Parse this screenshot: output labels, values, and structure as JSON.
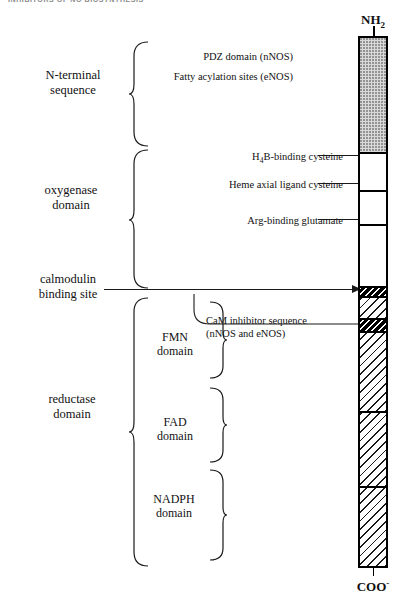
{
  "running_head": "INHIBITORS OF NO BIOSYNTHESIS",
  "diagram": {
    "termini": {
      "n_terminus": "NH2",
      "n_terminus_base": "NH",
      "n_terminus_sub": "2",
      "c_terminus": "COO",
      "c_terminus_sup": "-"
    },
    "left_labels": [
      {
        "id": "n-terminal",
        "text": "N-terminal\nsequence"
      },
      {
        "id": "oxygenase",
        "text": "oxygenase\ndomain"
      },
      {
        "id": "calmodulin",
        "text": "calmodulin\nbinding site"
      },
      {
        "id": "reductase",
        "text": "reductase\ndomain"
      }
    ],
    "inner_labels": [
      {
        "id": "fmn",
        "text": "FMN\ndomain"
      },
      {
        "id": "fad",
        "text": "FAD\ndomain"
      },
      {
        "id": "nadph",
        "text": "NADPH\ndomain"
      }
    ],
    "annotations": [
      {
        "id": "pdz",
        "text": "PDZ domain (nNOS)"
      },
      {
        "id": "fatty",
        "text": "Fatty acylation sites (eNOS)"
      },
      {
        "id": "h4b",
        "text": "H4B-binding cysteine",
        "pre": "H",
        "sub": "4",
        "post": "B-binding cysteine"
      },
      {
        "id": "heme",
        "text": "Heme axial ligand cysteine"
      },
      {
        "id": "arg",
        "text": "Arg-binding glutamate"
      },
      {
        "id": "cam-inhibitor",
        "text": "CaM inhibitor sequence\n(nNOS and eNOS)"
      }
    ],
    "bar_segments": [
      {
        "id": "n-terminal-stipple",
        "fill": "stipple",
        "top": 0,
        "height": 116
      },
      {
        "id": "oxy-upper-white",
        "fill": "white",
        "top": 116,
        "height": 38
      },
      {
        "id": "oxy-mid-white",
        "fill": "white",
        "top": 154,
        "height": 34
      },
      {
        "id": "oxy-lower-white",
        "fill": "white",
        "top": 188,
        "height": 62
      },
      {
        "id": "cam-black-hatch-1",
        "fill": "blackhatch",
        "top": 250,
        "height": 10
      },
      {
        "id": "cam-white-hatch",
        "fill": "hatch",
        "top": 260,
        "height": 22
      },
      {
        "id": "cam-black-hatch-2",
        "fill": "blackhatch",
        "top": 282,
        "height": 13
      },
      {
        "id": "fmn-domain",
        "fill": "hatch",
        "top": 295,
        "height": 80
      },
      {
        "id": "fad-domain",
        "fill": "hatch",
        "top": 375,
        "height": 75
      },
      {
        "id": "nadph-domain",
        "fill": "hatch",
        "top": 450,
        "height": 78
      }
    ],
    "colors": {
      "stroke": "#1a1a1a",
      "stipple": "#d9d9d9",
      "hatch_line": "#1a1a1a",
      "black": "#000000",
      "paper": "#ffffff"
    }
  }
}
